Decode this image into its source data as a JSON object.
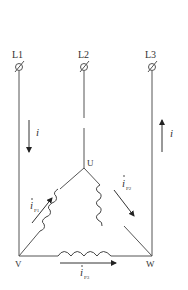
{
  "diagram": {
    "type": "delta-connected three-phase load",
    "terminals": [
      {
        "label": "L1"
      },
      {
        "label": "L2"
      },
      {
        "label": "L3"
      }
    ],
    "nodes": {
      "top": "U",
      "left": "V",
      "right": "W"
    },
    "line_currents": {
      "left": {
        "symbol": "i",
        "direction": "down"
      },
      "right": {
        "symbol": "i",
        "direction": "up"
      }
    },
    "phase_currents": [
      {
        "symbol": "i",
        "subscript": "P1",
        "branch": "V-U"
      },
      {
        "symbol": "i",
        "subscript": "P2",
        "branch": "U-W"
      },
      {
        "symbol": "i",
        "subscript": "P3",
        "branch": "V-W"
      }
    ],
    "colors": {
      "line": "#555555",
      "text": "#333333",
      "background": "#ffffff"
    }
  }
}
